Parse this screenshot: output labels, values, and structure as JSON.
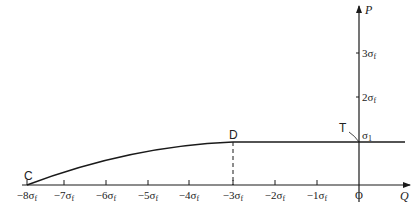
{
  "diagram": {
    "axes": {
      "x_label": "Q",
      "y_label": "P",
      "origin_label": "O"
    },
    "x_ticks": [
      {
        "label": "−8σ",
        "sub": "f",
        "x": 27
      },
      {
        "label": "−7σ",
        "sub": "f",
        "x": 64
      },
      {
        "label": "−6σ",
        "sub": "f",
        "x": 106
      },
      {
        "label": "−5σ",
        "sub": "f",
        "x": 148
      },
      {
        "label": "−4σ",
        "sub": "f",
        "x": 189
      },
      {
        "label": "−3σ",
        "sub": "f",
        "x": 233
      },
      {
        "label": "−2σ",
        "sub": "f",
        "x": 275
      },
      {
        "label": "−1σ",
        "sub": "f",
        "x": 317
      }
    ],
    "y_ticks": [
      {
        "label": "3σ",
        "sub": "f",
        "y": 53
      },
      {
        "label": "2σ",
        "sub": "f",
        "y": 97
      },
      {
        "label": "σ",
        "sub": "1",
        "y": 142
      }
    ],
    "points": {
      "C": "C",
      "D": "D",
      "T": "T"
    },
    "colors": {
      "line": "#1a1a1a",
      "text": "#222222"
    }
  }
}
